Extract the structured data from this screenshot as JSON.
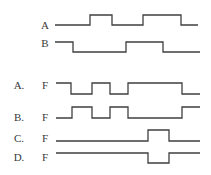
{
  "inputs": [
    {
      "label": "A",
      "label_pos": [
        45,
        25
      ],
      "points": [
        [
          55,
          25
        ],
        [
          90,
          25
        ],
        [
          90,
          15
        ],
        [
          112,
          15
        ],
        [
          112,
          25
        ],
        [
          143,
          25
        ],
        [
          143,
          15
        ],
        [
          181,
          15
        ],
        [
          181,
          25
        ],
        [
          198,
          25
        ]
      ]
    },
    {
      "label": "B",
      "label_pos": [
        45,
        43
      ],
      "points": [
        [
          55,
          42
        ],
        [
          73,
          42
        ],
        [
          73,
          52
        ],
        [
          126,
          52
        ],
        [
          126,
          42
        ],
        [
          163,
          42
        ],
        [
          163,
          52
        ],
        [
          200,
          52
        ]
      ]
    }
  ],
  "options": [
    {
      "letter": "A.",
      "signal": "F",
      "letter_pos": [
        19,
        85
      ],
      "signal_pos": [
        45,
        85
      ],
      "points": [
        [
          56,
          83
        ],
        [
          71,
          83
        ],
        [
          71,
          94
        ],
        [
          92,
          94
        ],
        [
          92,
          83
        ],
        [
          110,
          83
        ],
        [
          110,
          94
        ],
        [
          128,
          94
        ],
        [
          128,
          83
        ],
        [
          182,
          83
        ],
        [
          182,
          94
        ],
        [
          200,
          94
        ]
      ]
    },
    {
      "letter": "B.",
      "signal": "F",
      "letter_pos": [
        19,
        117
      ],
      "signal_pos": [
        45,
        117
      ],
      "points": [
        [
          56,
          118
        ],
        [
          72,
          118
        ],
        [
          72,
          107
        ],
        [
          92,
          107
        ],
        [
          92,
          118
        ],
        [
          110,
          118
        ],
        [
          110,
          107
        ],
        [
          128,
          107
        ],
        [
          128,
          118
        ],
        [
          182,
          118
        ],
        [
          182,
          107
        ],
        [
          200,
          107
        ]
      ]
    },
    {
      "letter": "C.",
      "signal": "F",
      "letter_pos": [
        19,
        138
      ],
      "signal_pos": [
        45,
        138
      ],
      "points": [
        [
          56,
          141
        ],
        [
          148,
          141
        ],
        [
          148,
          130
        ],
        [
          169,
          130
        ],
        [
          169,
          141
        ],
        [
          200,
          141
        ]
      ]
    },
    {
      "letter": "D.",
      "signal": "F",
      "letter_pos": [
        19,
        157
      ],
      "signal_pos": [
        45,
        157
      ],
      "points": [
        [
          56,
          153
        ],
        [
          148,
          153
        ],
        [
          148,
          163
        ],
        [
          169,
          163
        ],
        [
          169,
          153
        ],
        [
          200,
          153
        ]
      ]
    }
  ]
}
